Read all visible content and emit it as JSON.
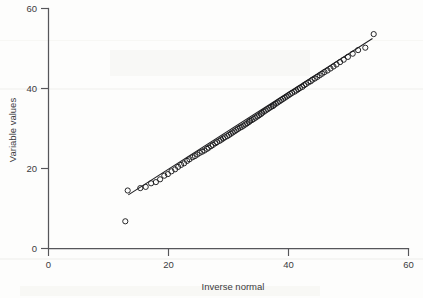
{
  "figure": {
    "kind": "qq-plot",
    "background_color": "#fdfdfc",
    "ink_color": "#1b1b1e",
    "axis_color": "#56565a"
  },
  "axes": {
    "x_title": "Inverse normal",
    "y_title": "Variable values",
    "x_ticks": [
      "0",
      "20",
      "40",
      "60"
    ],
    "y_ticks": [
      "0",
      "20",
      "40",
      "60"
    ]
  },
  "chart_data": {
    "type": "scatter",
    "title": "",
    "subtitle": "",
    "xlabel": "Inverse normal",
    "ylabel": "Variable values",
    "xlim": [
      0,
      60
    ],
    "ylim": [
      0,
      60
    ],
    "xticks": [
      0,
      20,
      40,
      60
    ],
    "yticks": [
      0,
      20,
      40,
      60
    ],
    "grid": false,
    "legend": null,
    "legend_position": "none",
    "annotations": [],
    "series": [
      {
        "name": "Sample quantiles",
        "marker": "open-circle",
        "marker_size": 2.6,
        "x": [
          12.8,
          13.2,
          15.3,
          16.2,
          17.1,
          17.9,
          18.6,
          19.3,
          19.9,
          20.5,
          21.1,
          21.6,
          22.1,
          22.6,
          23.1,
          23.5,
          24.0,
          24.4,
          24.8,
          25.2,
          25.6,
          26.0,
          26.4,
          26.7,
          27.1,
          27.4,
          27.8,
          28.1,
          28.5,
          28.8,
          29.1,
          29.4,
          29.8,
          30.1,
          30.4,
          30.7,
          31.0,
          31.3,
          31.6,
          31.9,
          32.2,
          32.5,
          32.8,
          33.1,
          33.4,
          33.6,
          33.9,
          34.2,
          34.5,
          34.8,
          35.1,
          35.4,
          35.6,
          35.9,
          36.2,
          36.5,
          36.8,
          37.1,
          37.4,
          37.6,
          37.9,
          38.2,
          38.5,
          38.8,
          39.1,
          39.4,
          39.7,
          40.0,
          40.3,
          40.6,
          41.0,
          41.3,
          41.6,
          41.9,
          42.3,
          42.6,
          42.9,
          43.3,
          43.7,
          44.0,
          44.4,
          44.8,
          45.2,
          45.6,
          46.0,
          46.5,
          47.0,
          47.5,
          48.0,
          48.6,
          49.2,
          49.9,
          50.7,
          51.6,
          52.8,
          54.2
        ],
        "y": [
          6.8,
          14.5,
          15.1,
          15.4,
          16.3,
          16.6,
          17.3,
          18.2,
          18.6,
          19.3,
          19.8,
          20.4,
          20.9,
          21.3,
          21.9,
          22.3,
          22.8,
          23.1,
          23.5,
          23.9,
          24.2,
          24.5,
          24.9,
          25.2,
          25.6,
          25.9,
          26.3,
          26.6,
          26.9,
          27.2,
          27.5,
          27.8,
          28.1,
          28.4,
          28.7,
          29.0,
          29.3,
          29.6,
          29.9,
          30.2,
          30.4,
          30.7,
          31.0,
          31.3,
          31.6,
          31.9,
          32.1,
          32.4,
          32.7,
          33.0,
          33.3,
          33.6,
          33.9,
          34.2,
          34.5,
          34.8,
          35.1,
          35.4,
          35.6,
          35.9,
          36.2,
          36.5,
          36.8,
          37.1,
          37.4,
          37.7,
          38.0,
          38.3,
          38.6,
          38.9,
          39.2,
          39.5,
          39.8,
          40.1,
          40.4,
          40.8,
          41.1,
          41.5,
          41.8,
          42.2,
          42.5,
          42.9,
          43.3,
          43.7,
          44.1,
          44.5,
          45.0,
          45.5,
          46.0,
          46.6,
          47.2,
          47.9,
          48.7,
          49.6,
          50.2,
          53.6
        ]
      }
    ],
    "reference_line": {
      "name": "y = x reference",
      "x_start": 13.3,
      "y_start": 13.4,
      "x_end": 54.0,
      "y_end": 52.5
    }
  }
}
